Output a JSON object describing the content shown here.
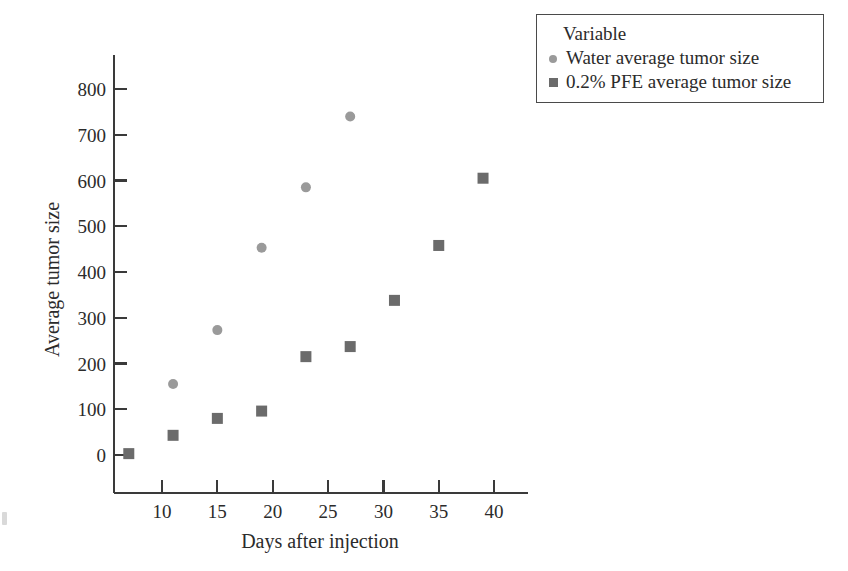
{
  "chart_data": {
    "type": "scatter",
    "title": "",
    "xlabel": "Days after injection",
    "ylabel": "Average tumor size",
    "xlim": [
      5,
      43
    ],
    "ylim": [
      -40,
      840
    ],
    "xticks": [
      10,
      15,
      20,
      25,
      30,
      35,
      40
    ],
    "yticks": [
      0,
      100,
      200,
      300,
      400,
      500,
      600,
      700,
      800
    ],
    "grid": false,
    "legend_position": "top-right-outside",
    "legend_title": "Variable",
    "series": [
      {
        "name": "Water average tumor size",
        "marker": "circle",
        "color": "#9a9a9a",
        "x": [
          11,
          15,
          19,
          23,
          27
        ],
        "y": [
          155,
          273,
          453,
          585,
          740
        ]
      },
      {
        "name": "0.2% PFE average tumor size",
        "marker": "square",
        "color": "#6b6b6b",
        "x": [
          7,
          11,
          15,
          19,
          23,
          27,
          31,
          35,
          39
        ],
        "y": [
          3,
          43,
          80,
          96,
          215,
          237,
          338,
          458,
          605
        ]
      }
    ]
  },
  "axes": {
    "x_title": "Days after injection",
    "y_title": "Average tumor size",
    "x_tick_labels": [
      "10",
      "15",
      "20",
      "25",
      "30",
      "35",
      "40"
    ],
    "y_tick_labels": [
      "0",
      "100",
      "200",
      "300",
      "400",
      "500",
      "600",
      "700",
      "800"
    ],
    "axis_color": "#3a3a3a"
  },
  "legend": {
    "title": "Variable",
    "entries": [
      {
        "label": "Water average tumor size",
        "marker": "circle",
        "color": "#9a9a9a"
      },
      {
        "label": "0.2% PFE average tumor size",
        "marker": "square",
        "color": "#6b6b6b"
      }
    ]
  }
}
